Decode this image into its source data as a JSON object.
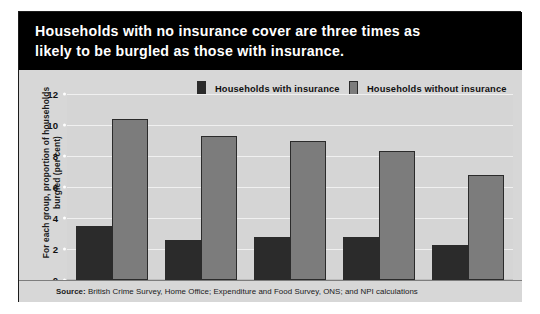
{
  "headline": {
    "line1": "Households with no insurance cover are three times as",
    "line2": "likely to be burgled as those with insurance."
  },
  "source": {
    "prefix": "Source:",
    "text": " British Crime Survey, Home Office; Expenditure and Food Survey, ONS; and NPI calculations"
  },
  "colors": {
    "banner_background": "#000000",
    "banner_text": "#ffffff",
    "panel_background": "#d7d7d7",
    "plot_background": "#d5d5d5",
    "gridline": "#f0f0f0",
    "series_with_insurance": "#2b2b2b",
    "series_without_insurance": "#7c7c7c",
    "bar_outline": "#2b2b2b"
  },
  "chart_data": {
    "type": "bar",
    "title": "Households with no insurance cover are three times as likely to be burgled as those with insurance.",
    "xlabel": "",
    "ylabel": "For each group, proportion of households burgled (per cent)",
    "ylim": [
      0,
      12
    ],
    "yticks": [
      0,
      2,
      4,
      6,
      8,
      10,
      12
    ],
    "ytick_labels": [
      "0",
      "2",
      "4",
      "6",
      "8",
      "10",
      "12"
    ],
    "grid": true,
    "legend_position": "top",
    "categories": [
      "1999",
      "2001/02",
      "2002/03",
      "2003/04",
      "2004/05"
    ],
    "series": [
      {
        "name": "Households with insurance",
        "color": "#2b2b2b",
        "values": [
          3.5,
          2.6,
          2.8,
          2.8,
          2.25
        ]
      },
      {
        "name": "Households without insurance",
        "color": "#7c7c7c",
        "values": [
          10.4,
          9.3,
          9.0,
          8.35,
          6.8
        ]
      }
    ]
  }
}
